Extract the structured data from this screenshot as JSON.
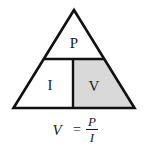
{
  "diagram": {
    "sections": {
      "top": {
        "label": "P",
        "fill": "#ffffff",
        "highlighted": false
      },
      "bottom_left": {
        "label": "I",
        "fill": "#ffffff",
        "highlighted": false
      },
      "bottom_right": {
        "label": "V",
        "fill": "#d9d9d9",
        "highlighted": true
      }
    },
    "stroke_color": "#111111",
    "formula": {
      "lhs": "V",
      "operator": "=",
      "numerator": "P",
      "denominator": "I"
    }
  }
}
